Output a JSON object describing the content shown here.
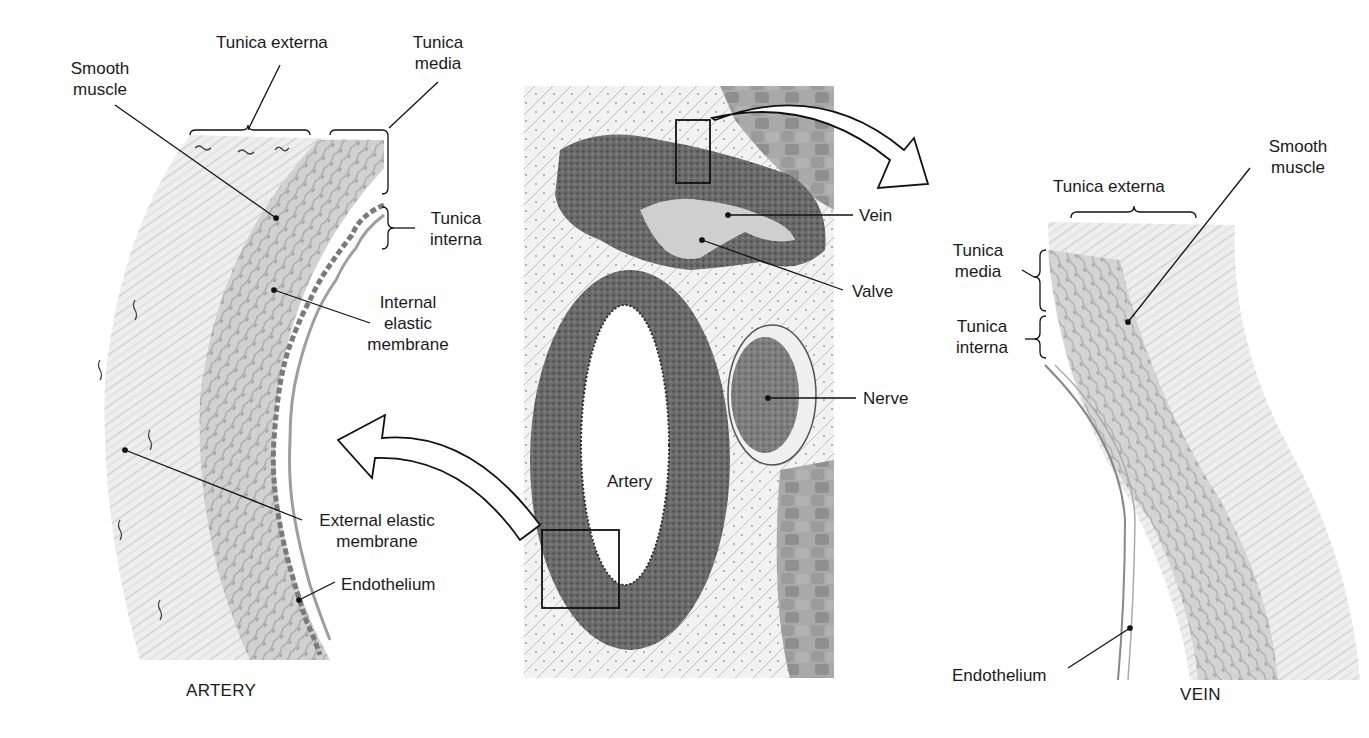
{
  "figure": {
    "left_panel": {
      "caption": "ARTERY",
      "labels": {
        "smooth_muscle": [
          "Smooth",
          "muscle"
        ],
        "tunica_externa": "Tunica externa",
        "tunica_media": [
          "Tunica",
          "media"
        ],
        "tunica_interna": [
          "Tunica",
          "interna"
        ],
        "internal_elastic_membrane": [
          "Internal",
          "elastic",
          "membrane"
        ],
        "external_elastic_membrane": [
          "External elastic",
          "membrane"
        ],
        "endothelium": "Endothelium"
      }
    },
    "center_panel": {
      "description": "Light micrograph cross-section",
      "labels": {
        "vein": "Vein",
        "valve": "Valve",
        "nerve": "Nerve",
        "artery": "Artery"
      }
    },
    "right_panel": {
      "caption": "VEIN",
      "labels": {
        "smooth_muscle": [
          "Smooth",
          "muscle"
        ],
        "tunica_externa": "Tunica externa",
        "tunica_media": [
          "Tunica",
          "media"
        ],
        "tunica_interna": [
          "Tunica",
          "interna"
        ],
        "endothelium": "Endothelium"
      }
    },
    "colors": {
      "ink": "#1a1a1a",
      "tissue_light": "#e4e4e4",
      "tissue_mid": "#c8c8c8",
      "tissue_dark": "#5a5a5a",
      "micrograph_bg": "#d9d9d9"
    }
  }
}
